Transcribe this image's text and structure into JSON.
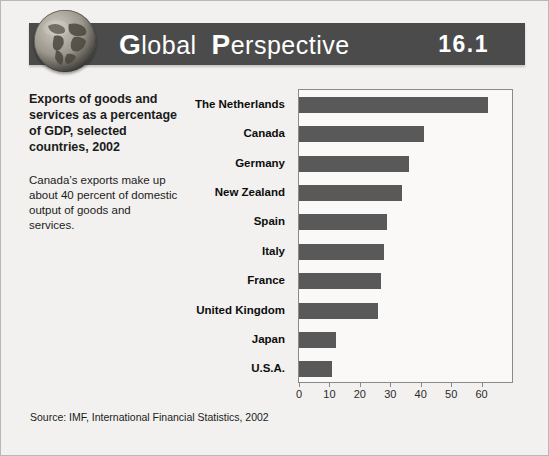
{
  "header": {
    "title_word_1": "Global",
    "title_word_2": "Perspective",
    "number": "16.1",
    "globe_icon_name": "globe-icon",
    "banner_color": "#4b4b4b",
    "title_color": "#ffffff"
  },
  "caption": {
    "main": "Exports of goods and services as a percentage of GDP, selected countries, 2002",
    "note": "Canada’s exports make up about 40 percent of domestic output of goods and services."
  },
  "source": "Source: IMF, International Financial Statistics, 2002",
  "chart_data": {
    "type": "bar",
    "orientation": "horizontal",
    "title": "Exports of goods and services as a percentage of GDP, selected countries, 2002",
    "xlabel": "",
    "ylabel": "",
    "xlim": [
      0,
      70
    ],
    "xticks": [
      0,
      10,
      20,
      30,
      40,
      50,
      60
    ],
    "xtick_labels": [
      "0",
      "10",
      "20",
      "30",
      "40",
      "50",
      "60"
    ],
    "grid": false,
    "legend": false,
    "bar_color": "#595959",
    "categories": [
      "The Netherlands",
      "Canada",
      "Germany",
      "New Zealand",
      "Spain",
      "Italy",
      "France",
      "United Kingdom",
      "Japan",
      "U.S.A."
    ],
    "values": [
      62,
      41,
      36,
      34,
      29,
      28,
      27,
      26,
      12,
      11
    ]
  }
}
